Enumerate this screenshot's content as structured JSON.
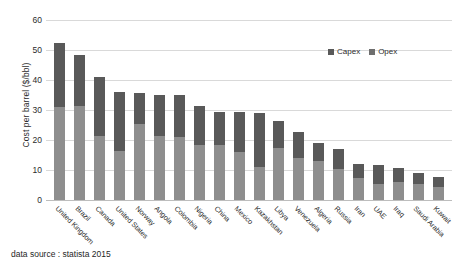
{
  "chart_data": {
    "type": "bar",
    "subtype": "stacked-column",
    "title": "",
    "xlabel": "",
    "ylabel": "Cost per barrel ($/bbl)",
    "ylim": [
      0,
      60
    ],
    "yticks": [
      0,
      10,
      20,
      30,
      40,
      50,
      60
    ],
    "grid": true,
    "legend_position": "top-right",
    "categories": [
      "United Kingdom",
      "Brazil",
      "Canada",
      "United States",
      "Norway",
      "Angola",
      "Colombia",
      "Nigeria",
      "China",
      "Mexico",
      "Kazakhstan",
      "Libya",
      "Venezuela",
      "Algeria",
      "Russia",
      "Iran",
      "UAE",
      "Iraq",
      "Saudi Arabia",
      "Kuwait"
    ],
    "series": [
      {
        "name": "Capex",
        "color": "#8e8e8e",
        "values": [
          31.0,
          31.5,
          21.5,
          16.5,
          25.5,
          21.5,
          21.0,
          18.5,
          18.5,
          16.0,
          11.0,
          17.5,
          14.0,
          13.0,
          10.5,
          7.5,
          5.5,
          6.0,
          5.5,
          4.5
        ]
      },
      {
        "name": "Opex",
        "color": "#595959",
        "values": [
          21.2,
          17.0,
          19.4,
          19.4,
          10.3,
          13.5,
          14.0,
          12.8,
          11.0,
          13.5,
          18.0,
          9.0,
          8.7,
          6.0,
          6.5,
          4.5,
          6.2,
          4.7,
          3.4,
          3.2
        ]
      }
    ],
    "totals": [
      52.2,
      48.5,
      40.9,
      35.9,
      35.8,
      35.0,
      35.0,
      31.3,
      29.5,
      29.5,
      29.0,
      26.5,
      22.7,
      19.0,
      17.0,
      12.0,
      11.7,
      10.7,
      8.9,
      7.7
    ],
    "legend": [
      "Capex",
      "Opex"
    ]
  },
  "legend": {
    "capex_label": "Capex",
    "opex_label": "Opex"
  },
  "axis": {
    "y_title": "Cost per barrel ($/bbl)",
    "y_ticks": [
      "60",
      "50",
      "40",
      "30",
      "20",
      "10",
      "0"
    ]
  },
  "footer": {
    "source": "data source : statista 2015"
  },
  "colors": {
    "capex": "#8e8e8e",
    "opex": "#595959",
    "grid": "#d9d9d9",
    "background": "#ffffff"
  }
}
